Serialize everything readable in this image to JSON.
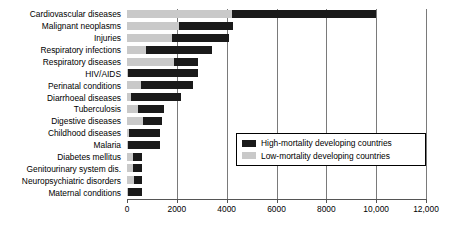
{
  "chart_data": {
    "type": "bar",
    "orientation": "horizontal",
    "stacked": true,
    "title": "",
    "xlabel": "",
    "ylabel": "",
    "xlim": [
      0,
      12000
    ],
    "grid": true,
    "legend_position": "inside-right-middle",
    "categories": [
      "Cardiovascular diseases",
      "Malignant neoplasms",
      "Injuries",
      "Respiratory infections",
      "Respiratory diseases",
      "HIV/AIDS",
      "Perinatal conditions",
      "Diarrhoeal diseases",
      "Tuberculosis",
      "Digestive diseases",
      "Childhood diseases",
      "Malaria",
      "Diabetes mellitus",
      "Genitourinary system dis.",
      "Neuropsychiatric disorders",
      "Maternal conditions"
    ],
    "series": [
      {
        "name": "Low-mortality developing countries",
        "color": "#c9c9c9",
        "values": [
          4200,
          2100,
          1800,
          750,
          1900,
          50,
          560,
          170,
          450,
          640,
          100,
          30,
          250,
          250,
          270,
          40
        ]
      },
      {
        "name": "High-mortality developing countries",
        "color": "#1a1a1a",
        "values": [
          5800,
          2150,
          2300,
          2650,
          950,
          2800,
          2090,
          2000,
          1050,
          760,
          1220,
          1300,
          360,
          360,
          350,
          580
        ]
      }
    ],
    "totals": [
      10000,
      4250,
      4100,
      3400,
      2850,
      2850,
      2650,
      2170,
      1500,
      1400,
      1320,
      1330,
      610,
      610,
      620,
      620
    ],
    "xticks": [
      0,
      2000,
      4000,
      6000,
      8000,
      10000,
      12000
    ],
    "xticklabels": [
      "0",
      "2000",
      "4000",
      "6000",
      "8000",
      "10,000",
      "12,000"
    ]
  },
  "legend": {
    "items": [
      {
        "label": "High-mortality developing countries",
        "swatch": "high"
      },
      {
        "label": "Low-mortality developing countries",
        "swatch": "low"
      }
    ]
  },
  "colors": {
    "high_mortality": "#1a1a1a",
    "low_mortality": "#c9c9c9",
    "gridline": "#7a7a7a",
    "axis": "#555555",
    "background": "#ffffff"
  }
}
